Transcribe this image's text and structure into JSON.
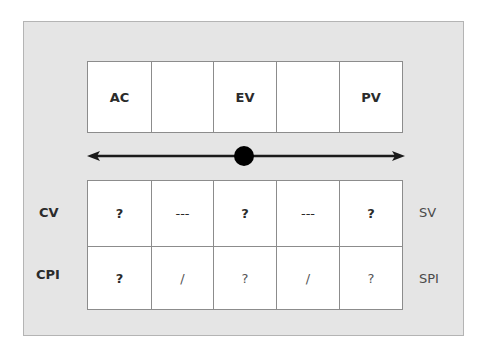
{
  "diagram": {
    "top_row": {
      "cells": [
        "AC",
        "",
        "EV",
        "",
        "PV"
      ]
    },
    "scale": {
      "line_color": "#1a1a1a",
      "marker_color": "#000000",
      "arrows": "both"
    },
    "bottom_table": {
      "row_labels_left": [
        "CV",
        "CPI"
      ],
      "row_labels_right": [
        "SV",
        "SPI"
      ],
      "rows": [
        [
          "?",
          "---",
          "?",
          "---",
          "?"
        ],
        [
          "?",
          "/",
          "?",
          "/",
          "?"
        ]
      ]
    },
    "colors": {
      "panel_bg": "#e5e5e5",
      "panel_border": "#b4b4b4",
      "cell_bg": "#ffffff",
      "grid_line": "#8c8c8c",
      "text": "#2b2b2b"
    }
  }
}
